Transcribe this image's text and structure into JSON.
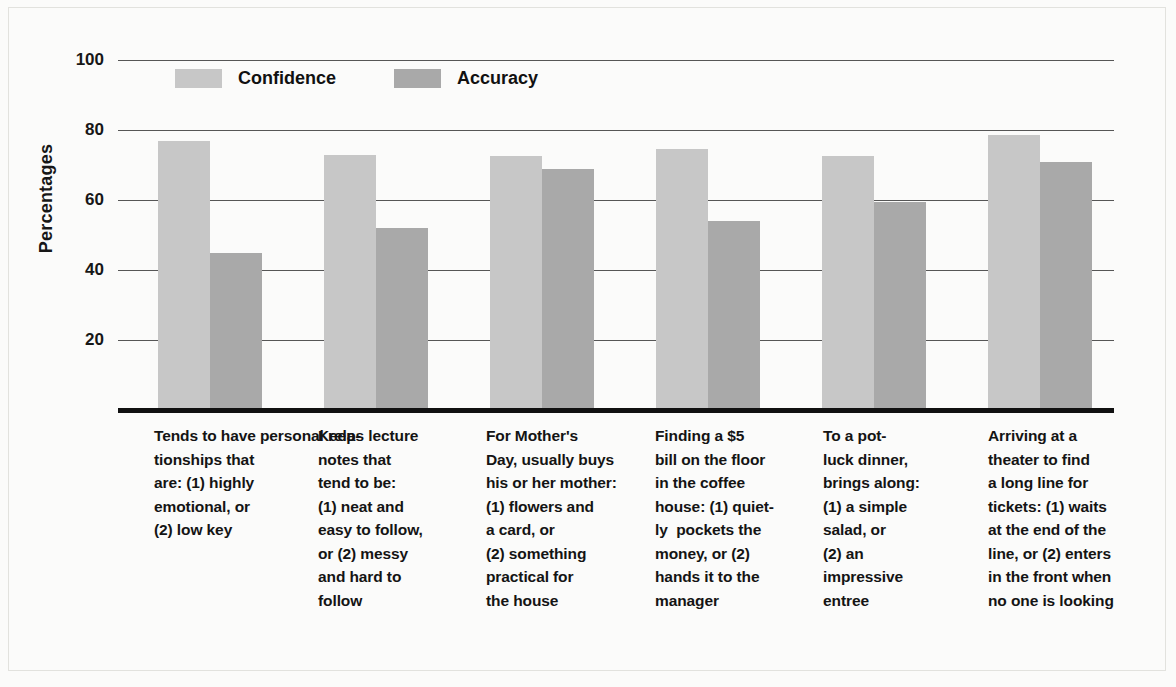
{
  "chart_data": {
    "type": "bar",
    "title": "",
    "subtitle": "",
    "xlabel": "",
    "ylabel": "Percentages",
    "ylim": [
      0,
      100
    ],
    "ytick_labels": [
      "100",
      "80",
      "60",
      "40",
      "20"
    ],
    "yticks": [
      100,
      80,
      60,
      40,
      20
    ],
    "grid": true,
    "legend_position": "top-left (inside plot)",
    "categories": [
      "Tends to have personal rela-\ntionships that\nare: (1) highly\nemotional, or\n(2) low key",
      "Keeps lecture\nnotes that\ntend to be:\n(1) neat and\neasy to follow,\nor (2) messy\nand hard to\nfollow",
      "For Mother's\nDay, usually buys\nhis or her mother:\n(1) flowers and\na card, or\n(2) something\npractical for\nthe house",
      "Finding a $5\nbill on the floor\nin the coffee\nhouse: (1) quiet-\nly  pockets the\nmoney, or (2)\nhands it to the\nmanager",
      "To a pot-\nluck dinner,\nbrings along:\n(1) a simple\nsalad, or\n(2) an\nimpressive\nentree",
      "Arriving at a\ntheater to find\na long line for\ntickets: (1) waits\nat the end of the\nline, or (2) enters\nin the front when\nno one is looking"
    ],
    "series": [
      {
        "name": "Confidence",
        "color": "#c7c7c7",
        "values": [
          77,
          73,
          72.5,
          74.5,
          72.5,
          78.5
        ]
      },
      {
        "name": "Accuracy",
        "color": "#a9a9a9",
        "values": [
          45,
          52,
          69,
          54,
          59.5,
          71
        ]
      }
    ]
  },
  "legend": {
    "items": [
      {
        "label": "Confidence",
        "color": "#c7c7c7"
      },
      {
        "label": "Accuracy",
        "color": "#a9a9a9"
      }
    ]
  },
  "axis": {
    "y_title": "Percentages",
    "y_labels": [
      "100",
      "80",
      "60",
      "40",
      "20"
    ]
  },
  "captions": [
    "Tends to have personal rela- tionships that are: (1) highly emotional, or (2) low key",
    "Keeps lecture notes that tend to be: (1) neat and easy to follow, or (2) messy and hard to follow",
    "For Mother's Day, usually buys his or her mother: (1) flowers and a card, or (2) something practical for the house",
    "Finding a $5 bill on the floor in the coffee house: (1) quiet- ly  pockets the money, or (2) hands it to the manager",
    "To a pot- luck dinner, brings along: (1) a simple salad, or (2) an impressive entree",
    "Arriving at a theater to find a long line for tickets: (1) waits at the end of the line, or (2) enters in the front when no one is looking"
  ],
  "colors": {
    "confidence": "#c7c7c7",
    "accuracy": "#a9a9a9",
    "axis": "#111111",
    "grid": "#565656",
    "background": "#fbfbfa"
  }
}
